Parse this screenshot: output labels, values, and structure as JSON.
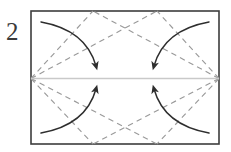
{
  "figure": {
    "kind": "origami-fold-diagram",
    "step_label": "2",
    "caption": "",
    "colors": {
      "ink": "#2e2e2e",
      "border": "#3d3d3d",
      "fold_dashed": "#9a9a9a",
      "center_line": "#c9c9c9",
      "background": "#ffffff",
      "label": "#3a3a3a"
    },
    "paper": {
      "name": "rectangle-sheet",
      "x": 31,
      "y": 11,
      "width": 188,
      "height": 133,
      "stroke_width": 1.6
    },
    "center_line": {
      "name": "horizontal-center-crease",
      "x1": 31,
      "y1": 78.5,
      "x2": 219,
      "y2": 78.5,
      "style": "solid",
      "stroke_width": 1.4
    },
    "fold_lines": [
      {
        "name": "fold-line-upper-left",
        "from": [
          31,
          78.5
        ],
        "to": [
          93,
          11
        ],
        "style": "dashed"
      },
      {
        "name": "fold-line-upper-right",
        "from": [
          219,
          78.5
        ],
        "to": [
          157,
          11
        ],
        "style": "dashed"
      },
      {
        "name": "fold-line-lower-left",
        "from": [
          31,
          78.5
        ],
        "to": [
          93,
          144
        ],
        "style": "dashed"
      },
      {
        "name": "fold-line-lower-right",
        "from": [
          219,
          78.5
        ],
        "to": [
          157,
          144
        ],
        "style": "dashed"
      },
      {
        "name": "fold-line-upper-left-long",
        "from": [
          31,
          78.5
        ],
        "to": [
          157,
          11
        ],
        "style": "dashed"
      },
      {
        "name": "fold-line-upper-right-long",
        "from": [
          219,
          78.5
        ],
        "to": [
          93,
          11
        ],
        "style": "dashed"
      },
      {
        "name": "fold-line-lower-left-long",
        "from": [
          31,
          78.5
        ],
        "to": [
          157,
          144
        ],
        "style": "dashed"
      },
      {
        "name": "fold-line-lower-right-long",
        "from": [
          219,
          78.5
        ],
        "to": [
          93,
          144
        ],
        "style": "dashed"
      }
    ],
    "arrows": [
      {
        "name": "fold-arrow-top-left",
        "direction": "down-right",
        "start": [
          41,
          22
        ],
        "control": [
          86,
          30
        ],
        "end": [
          96,
          66
        ],
        "description": "top-left corner folds down to center"
      },
      {
        "name": "fold-arrow-top-right",
        "direction": "down-left",
        "start": [
          209,
          22
        ],
        "control": [
          164,
          30
        ],
        "end": [
          154,
          66
        ],
        "description": "top-right corner folds down to center"
      },
      {
        "name": "fold-arrow-bottom-left",
        "direction": "up-right",
        "start": [
          41,
          133
        ],
        "control": [
          86,
          125
        ],
        "end": [
          96,
          89
        ],
        "description": "bottom-left corner folds up to center"
      },
      {
        "name": "fold-arrow-bottom-right",
        "direction": "up-left",
        "start": [
          209,
          133
        ],
        "control": [
          164,
          125
        ],
        "end": [
          154,
          89
        ],
        "description": "bottom-right corner folds up to center"
      }
    ],
    "label_position": {
      "x": 6,
      "y": 40
    }
  }
}
